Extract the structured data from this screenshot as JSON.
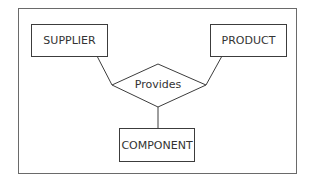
{
  "diagram": {
    "type": "entity-relationship",
    "entities": [
      {
        "id": "supplier",
        "label": "SUPPLIER"
      },
      {
        "id": "product",
        "label": "PRODUCT"
      },
      {
        "id": "component",
        "label": "COMPONENT"
      }
    ],
    "relationships": [
      {
        "id": "provides",
        "label": "Provides",
        "connects": [
          "supplier",
          "product",
          "component"
        ]
      }
    ]
  }
}
